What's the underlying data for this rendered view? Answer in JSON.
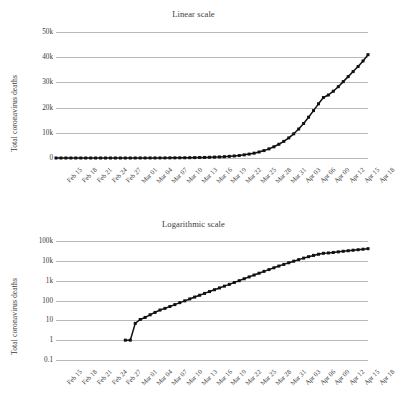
{
  "figure": {
    "background_color": "#ffffff",
    "gridline_color": "#b9b9b9",
    "series_color": "#111111"
  },
  "chart_data": [
    {
      "type": "line",
      "title": "Linear scale",
      "xlabel": "",
      "ylabel": "Total coronavirus deaths",
      "yscale": "linear",
      "ylim": [
        0,
        50000
      ],
      "yticks": [
        0,
        10000,
        20000,
        30000,
        40000,
        50000
      ],
      "ytick_labels": [
        "0",
        "10k",
        "20k",
        "30k",
        "40k",
        "50k"
      ],
      "grid": true,
      "legend": "none",
      "marker": "square",
      "x": [
        "Feb 15",
        "Feb 16",
        "Feb 17",
        "Feb 18",
        "Feb 19",
        "Feb 20",
        "Feb 21",
        "Feb 22",
        "Feb 23",
        "Feb 24",
        "Feb 25",
        "Feb 26",
        "Feb 27",
        "Feb 28",
        "Feb 29",
        "Mar 01",
        "Mar 02",
        "Mar 03",
        "Mar 04",
        "Mar 05",
        "Mar 06",
        "Mar 07",
        "Mar 08",
        "Mar 09",
        "Mar 10",
        "Mar 11",
        "Mar 12",
        "Mar 13",
        "Mar 14",
        "Mar 15",
        "Mar 16",
        "Mar 17",
        "Mar 18",
        "Mar 19",
        "Mar 20",
        "Mar 21",
        "Mar 22",
        "Mar 23",
        "Mar 24",
        "Mar 25",
        "Mar 26",
        "Mar 27",
        "Mar 28",
        "Mar 29",
        "Mar 30",
        "Mar 31",
        "Apr 01",
        "Apr 02",
        "Apr 03",
        "Apr 04",
        "Apr 05",
        "Apr 06",
        "Apr 07",
        "Apr 08",
        "Apr 09",
        "Apr 10",
        "Apr 11",
        "Apr 12",
        "Apr 13",
        "Apr 14",
        "Apr 15",
        "Apr 16",
        "Apr 17",
        "Apr 18"
      ],
      "xtick_labels": [
        "Feb 15",
        "Feb 18",
        "Feb 21",
        "Feb 24",
        "Feb 27",
        "Mar 01",
        "Mar 04",
        "Mar 07",
        "Mar 10",
        "Mar 13",
        "Mar 16",
        "Mar 19",
        "Mar 22",
        "Mar 25",
        "Mar 28",
        "Mar 31",
        "Apr 03",
        "Apr 06",
        "Apr 09",
        "Apr 12",
        "Apr 15",
        "Apr 18"
      ],
      "xtick_indices": [
        0,
        3,
        6,
        9,
        12,
        15,
        18,
        21,
        24,
        27,
        30,
        33,
        36,
        39,
        42,
        45,
        48,
        51,
        54,
        57,
        60,
        63
      ],
      "values": [
        0,
        0,
        0,
        0,
        0,
        0,
        0,
        0,
        0,
        0,
        0,
        0,
        0,
        0,
        1,
        1,
        7,
        11,
        14,
        19,
        25,
        33,
        40,
        50,
        62,
        78,
        96,
        120,
        149,
        184,
        228,
        282,
        350,
        430,
        530,
        650,
        810,
        1000,
        1250,
        1550,
        1920,
        2380,
        2940,
        3620,
        4450,
        5450,
        6600,
        7980,
        9600,
        11500,
        13700,
        16200,
        18800,
        21500,
        24000,
        25000,
        26500,
        28300,
        30300,
        32300,
        34300,
        36300,
        38500,
        41000
      ]
    },
    {
      "type": "line",
      "title": "Logarithmic scale",
      "xlabel": "",
      "ylabel": "Total coronavirus deaths",
      "yscale": "log",
      "ylim": [
        0.1,
        100000
      ],
      "yticks": [
        0.1,
        1,
        10,
        100,
        1000,
        10000,
        100000
      ],
      "ytick_labels": [
        "0.1",
        "1",
        "10",
        "100",
        "1k",
        "10k",
        "100k"
      ],
      "grid": true,
      "legend": "none",
      "marker": "square",
      "x": [
        "Feb 15",
        "Feb 16",
        "Feb 17",
        "Feb 18",
        "Feb 19",
        "Feb 20",
        "Feb 21",
        "Feb 22",
        "Feb 23",
        "Feb 24",
        "Feb 25",
        "Feb 26",
        "Feb 27",
        "Feb 28",
        "Feb 29",
        "Mar 01",
        "Mar 02",
        "Mar 03",
        "Mar 04",
        "Mar 05",
        "Mar 06",
        "Mar 07",
        "Mar 08",
        "Mar 09",
        "Mar 10",
        "Mar 11",
        "Mar 12",
        "Mar 13",
        "Mar 14",
        "Mar 15",
        "Mar 16",
        "Mar 17",
        "Mar 18",
        "Mar 19",
        "Mar 20",
        "Mar 21",
        "Mar 22",
        "Mar 23",
        "Mar 24",
        "Mar 25",
        "Mar 26",
        "Mar 27",
        "Mar 28",
        "Mar 29",
        "Mar 30",
        "Mar 31",
        "Apr 01",
        "Apr 02",
        "Apr 03",
        "Apr 04",
        "Apr 05",
        "Apr 06",
        "Apr 07",
        "Apr 08",
        "Apr 09",
        "Apr 10",
        "Apr 11",
        "Apr 12",
        "Apr 13",
        "Apr 14",
        "Apr 15",
        "Apr 16",
        "Apr 17",
        "Apr 18"
      ],
      "xtick_labels": [
        "Feb 15",
        "Feb 18",
        "Feb 21",
        "Feb 24",
        "Feb 27",
        "Mar 01",
        "Mar 04",
        "Mar 07",
        "Mar 10",
        "Mar 13",
        "Mar 16",
        "Mar 19",
        "Mar 22",
        "Mar 25",
        "Mar 28",
        "Mar 31",
        "Apr 03",
        "Apr 06",
        "Apr 09",
        "Apr 12",
        "Apr 15",
        "Apr 18"
      ],
      "xtick_indices": [
        0,
        3,
        6,
        9,
        12,
        15,
        18,
        21,
        24,
        27,
        30,
        33,
        36,
        39,
        42,
        45,
        48,
        51,
        54,
        57,
        60,
        63
      ],
      "values": [
        null,
        null,
        null,
        null,
        null,
        null,
        null,
        null,
        null,
        null,
        null,
        null,
        null,
        null,
        1,
        1,
        7,
        11,
        14,
        19,
        25,
        33,
        40,
        50,
        62,
        78,
        96,
        120,
        149,
        184,
        228,
        282,
        350,
        430,
        530,
        650,
        810,
        1000,
        1250,
        1550,
        1920,
        2380,
        2940,
        3620,
        4450,
        5450,
        6600,
        7980,
        9600,
        11500,
        13700,
        16200,
        18800,
        21500,
        24000,
        25000,
        26500,
        28300,
        30300,
        32300,
        34300,
        36300,
        38500,
        41000
      ]
    }
  ]
}
